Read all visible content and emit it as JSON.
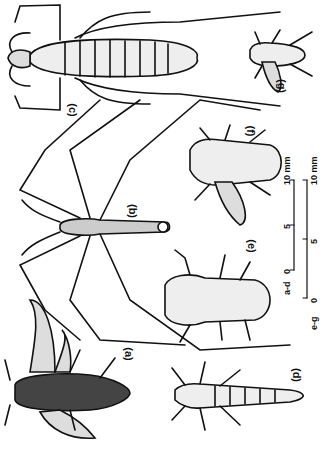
{
  "figure": {
    "panels": [
      {
        "id": "a",
        "label": "(a)",
        "description": "winged insect, dark dotted body, two wings"
      },
      {
        "id": "b",
        "label": "(b)",
        "description": "long-legged slender insect"
      },
      {
        "id": "c",
        "label": "(c)",
        "description": "large cricket-like insect with long hind legs"
      },
      {
        "id": "d",
        "label": "(d)",
        "description": "elongated segmented insect"
      },
      {
        "id": "e",
        "label": "(e)",
        "description": "rounded beetle-like insect"
      },
      {
        "id": "f",
        "label": "(f)",
        "description": "insect with wing extended"
      },
      {
        "id": "g",
        "label": "(g)",
        "description": "small insect with wing extended"
      }
    ],
    "scale_bars": [
      {
        "group": "a-d",
        "ticks": [
          "0",
          "5",
          "10 mm"
        ]
      },
      {
        "group": "e-g",
        "ticks": [
          "0",
          "5",
          "10 mm"
        ]
      }
    ]
  }
}
